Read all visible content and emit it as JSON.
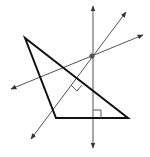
{
  "diagram": {
    "type": "geometry-triangle-perpendiculars",
    "width": 150,
    "height": 157,
    "colors": {
      "background": "#ffffff",
      "triangle_stroke": "#111111",
      "line_stroke": "#555555",
      "point_fill": "#555555"
    },
    "triangle": {
      "vertices": [
        {
          "name": "top-left",
          "x": 25,
          "y": 38
        },
        {
          "name": "bottom-left",
          "x": 56,
          "y": 118
        },
        {
          "name": "bottom-right",
          "x": 128,
          "y": 118
        }
      ],
      "stroke_width": 2
    },
    "lines": [
      {
        "name": "vertical-line",
        "x1": 93,
        "y1": 148,
        "x2": 93,
        "y2": 6
      },
      {
        "name": "steep-line",
        "x1": 31,
        "y1": 139,
        "x2": 126,
        "y2": 12
      },
      {
        "name": "shallow-line",
        "x1": 11,
        "y1": 89,
        "x2": 143,
        "y2": 35
      }
    ],
    "intersection_point": {
      "x": 92,
      "y": 56,
      "r": 2.6
    },
    "right_angle_markers": [
      {
        "name": "base-right-angle",
        "points": "93,110 101,110 101,118"
      },
      {
        "name": "side-right-angle",
        "points": "71,85 77,91 82,85"
      }
    ]
  }
}
